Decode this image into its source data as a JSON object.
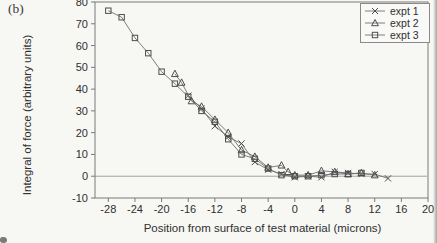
{
  "figure": {
    "panel_label": "(b)"
  },
  "colors": {
    "background": "#f7f7f4",
    "frame": "#7a7a7a",
    "line": "#6f6f6f",
    "marker": "#4d4d4d",
    "text": "#2f2f2f",
    "zero_line": "#8c8c8c",
    "legend_bg": "#f9f9f7"
  },
  "chart_data": {
    "type": "line",
    "title": "",
    "xlabel": "Position from surface of test material (microns)",
    "ylabel": "Integral of force (arbitrary units)",
    "xlim": [
      -30,
      20
    ],
    "ylim": [
      -10,
      80
    ],
    "x_ticks": [
      -28,
      -24,
      -20,
      -16,
      -12,
      -8,
      -4,
      0,
      4,
      8,
      12,
      16,
      20
    ],
    "y_ticks": [
      -10,
      0,
      10,
      20,
      30,
      40,
      50,
      60,
      70,
      80
    ],
    "grid": false,
    "zero_reference_line": 0,
    "legend_position": "top-right",
    "series": [
      {
        "name": "expt 1",
        "marker": "x",
        "points": [
          [
            -16,
            37
          ],
          [
            -14,
            31
          ],
          [
            -12,
            23
          ],
          [
            -10,
            18
          ],
          [
            -8,
            15
          ],
          [
            -6,
            6.5
          ],
          [
            -4,
            3
          ],
          [
            -2,
            1
          ],
          [
            0,
            -0.5
          ],
          [
            2,
            0
          ],
          [
            4,
            -0.5
          ],
          [
            6,
            2
          ],
          [
            8,
            1.5
          ],
          [
            10,
            1
          ],
          [
            12,
            1
          ],
          [
            14,
            -1
          ]
        ]
      },
      {
        "name": "expt 2",
        "marker": "triangle",
        "points": [
          [
            -18,
            47
          ],
          [
            -17,
            43
          ],
          [
            -15.5,
            34.5
          ],
          [
            -14,
            32
          ],
          [
            -12,
            26
          ],
          [
            -10,
            20
          ],
          [
            -8,
            12
          ],
          [
            -6,
            9
          ],
          [
            -4,
            4
          ],
          [
            -2,
            5
          ],
          [
            -1,
            2
          ],
          [
            0,
            0.5
          ],
          [
            2,
            0.5
          ],
          [
            4,
            2.5
          ],
          [
            6,
            2
          ],
          [
            8,
            1
          ],
          [
            10,
            1.5
          ],
          [
            12,
            0.5
          ]
        ]
      },
      {
        "name": "expt 3",
        "marker": "square",
        "points": [
          [
            -28,
            76
          ],
          [
            -26,
            73
          ],
          [
            -24,
            63.5
          ],
          [
            -22,
            56.5
          ],
          [
            -20,
            48
          ],
          [
            -18,
            42.5
          ],
          [
            -16,
            36.5
          ],
          [
            -14,
            30
          ],
          [
            -12,
            25
          ],
          [
            -10,
            17
          ],
          [
            -8,
            10
          ],
          [
            -6,
            8
          ],
          [
            -4,
            3.5
          ],
          [
            -2,
            0.5
          ],
          [
            0,
            0
          ],
          [
            2,
            0
          ],
          [
            4,
            0.5
          ],
          [
            6,
            1
          ],
          [
            8,
            1
          ],
          [
            10,
            1.5
          ]
        ]
      }
    ]
  }
}
